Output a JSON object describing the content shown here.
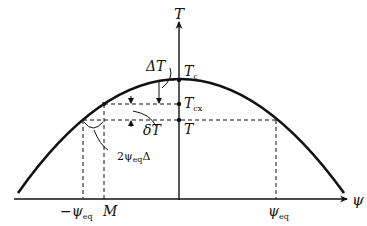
{
  "diagram": {
    "type": "phase-diagram-parabola",
    "axes": {
      "vertical": {
        "label": "T"
      },
      "horizontal": {
        "label": "ψ"
      }
    },
    "curve": {
      "shape": "inverted-parabola",
      "color": "#111111"
    },
    "levels": [
      {
        "name": "Tc",
        "symbol": "T",
        "subscript": "c"
      },
      {
        "name": "Tcx",
        "symbol": "T",
        "subscript": "cx"
      },
      {
        "name": "T",
        "symbol": "T",
        "subscript": ""
      }
    ],
    "annotations": {
      "delta_T_cap": {
        "symbol": "ΔT",
        "subscript": ""
      },
      "delta_T_small": {
        "symbol": "δT"
      },
      "width": {
        "prefix": "2ψ",
        "subscript": "eq",
        "suffix": "Δ"
      }
    },
    "x_ticks": [
      {
        "label": "−ψ",
        "subscript": "eq"
      },
      {
        "label": "M",
        "subscript": ""
      },
      {
        "label": "ψ",
        "subscript": "eq"
      }
    ]
  }
}
